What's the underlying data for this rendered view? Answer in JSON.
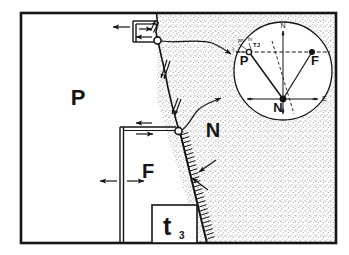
{
  "figure": {
    "title_labels": {
      "plate_p": "P",
      "plate_n": "N",
      "plate_f": "F",
      "time_box": "t",
      "time_box_sub": "3"
    },
    "inset": {
      "point_p": "P",
      "point_f": "F",
      "point_n": "N",
      "compass_north": "N",
      "compass_east": "E",
      "micro_left": "f",
      "micro_a": "pn",
      "micro_b": "fn",
      "micro_c": "TJ"
    },
    "colors": {
      "ink": "#141414",
      "stipple": "#7c7c7c",
      "paper": "#ffffff",
      "plate_n_fill": "#efefef"
    },
    "geometry": {
      "frame": {
        "x": 21,
        "y": 13,
        "w": 315,
        "h": 230
      },
      "inset_circle": {
        "cx": 283,
        "cy": 71,
        "r": 49
      }
    }
  }
}
